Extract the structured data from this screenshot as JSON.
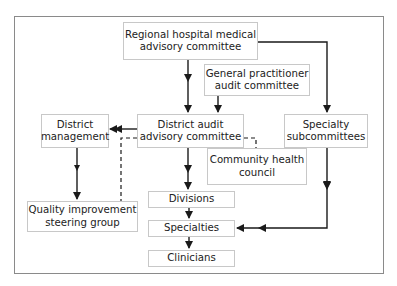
{
  "nodes": {
    "regional": {
      "label": "Regional hospital medical advisory committee"
    },
    "gp_audit": {
      "label": "General practitioner audit committee"
    },
    "district_audit": {
      "label": "District audit advisory committee"
    },
    "district_management": {
      "label": "District management"
    },
    "specialty_subcommittees": {
      "label": "Specialty subcommittees"
    },
    "community_health": {
      "label": "Community health council"
    },
    "divisions": {
      "label": "Divisions"
    },
    "specialties": {
      "label": "Specialties"
    },
    "clinicians": {
      "label": "Clinicians"
    },
    "quality_improvement": {
      "label": "Quality improvement steering group"
    }
  },
  "edges": [
    {
      "from": "regional",
      "to": "district_audit",
      "style": "solid"
    },
    {
      "from": "regional",
      "to": "specialty_subcommittees",
      "style": "solid"
    },
    {
      "from": "gp_audit",
      "to": "district_audit",
      "style": "solid"
    },
    {
      "from": "district_audit",
      "to": "district_management",
      "style": "solid"
    },
    {
      "from": "district_audit",
      "to": "divisions",
      "style": "solid"
    },
    {
      "from": "district_management",
      "to": "quality_improvement",
      "style": "solid"
    },
    {
      "from": "divisions",
      "to": "specialties",
      "style": "solid"
    },
    {
      "from": "specialties",
      "to": "clinicians",
      "style": "solid"
    },
    {
      "from": "specialty_subcommittees",
      "to": "specialties",
      "style": "solid"
    },
    {
      "from": "district_audit",
      "to": "quality_improvement",
      "style": "dashed"
    },
    {
      "from": "district_audit",
      "to": "community_health",
      "style": "dashed"
    }
  ],
  "colors": {
    "line": "#1a1a1a",
    "box_border": "#c8c8c8",
    "frame": "#8a8a8a"
  }
}
